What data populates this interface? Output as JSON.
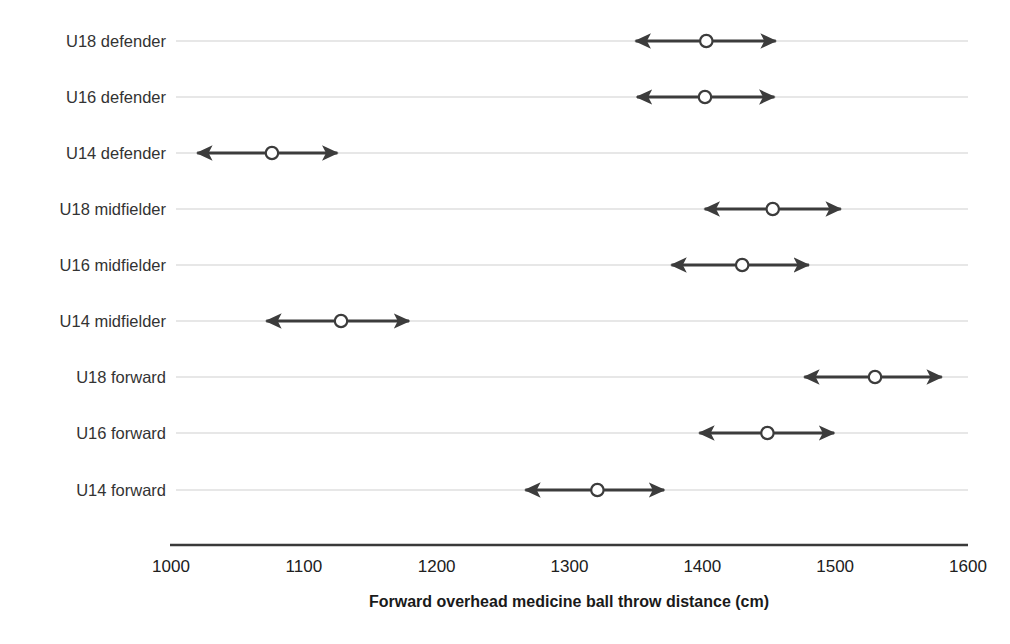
{
  "figure": {
    "background_color": "#ffffff",
    "line_color": "#3c3c3c",
    "grid_color": "#c9c9c9",
    "marker_fill": "#ffffff"
  },
  "axis": {
    "x_title": "Forward overhead medicine ball throw distance (cm)",
    "ticks": [
      "1000",
      "1100",
      "1200",
      "1300",
      "1400",
      "1500",
      "1600"
    ]
  },
  "chart_data": {
    "type": "scatter",
    "title": "",
    "xlabel": "Forward overhead medicine ball throw distance (cm)",
    "ylabel": "",
    "xlim": [
      1000,
      1600
    ],
    "grid": true,
    "legend": "none",
    "categories": [
      "U18 defender",
      "U16 defender",
      "U14 defender",
      "U18 midfielder",
      "U16 midfielder",
      "U14 midfielder",
      "U18 forward",
      "U16 forward",
      "U14 forward"
    ],
    "values": [
      1403,
      1402,
      1076,
      1453,
      1430,
      1128,
      1530,
      1449,
      1321
    ],
    "lower": [
      1343,
      1344,
      1013,
      1395,
      1370,
      1065,
      1470,
      1391,
      1260
    ],
    "upper": [
      1462,
      1461,
      1132,
      1511,
      1487,
      1186,
      1587,
      1506,
      1378
    ],
    "series": [
      {
        "name": "Mean with range",
        "points": [
          {
            "category": "U18 defender",
            "mean": 1403,
            "lower": 1343,
            "upper": 1462
          },
          {
            "category": "U16 defender",
            "mean": 1402,
            "lower": 1344,
            "upper": 1461
          },
          {
            "category": "U14 defender",
            "mean": 1076,
            "lower": 1013,
            "upper": 1132
          },
          {
            "category": "U18 midfielder",
            "mean": 1453,
            "lower": 1395,
            "upper": 1511
          },
          {
            "category": "U16 midfielder",
            "mean": 1430,
            "lower": 1370,
            "upper": 1487
          },
          {
            "category": "U14 midfielder",
            "mean": 1128,
            "lower": 1065,
            "upper": 1186
          },
          {
            "category": "U18 forward",
            "mean": 1530,
            "lower": 1470,
            "upper": 1587
          },
          {
            "category": "U16 forward",
            "mean": 1449,
            "lower": 1391,
            "upper": 1506
          },
          {
            "category": "U14 forward",
            "mean": 1321,
            "lower": 1260,
            "upper": 1378
          }
        ]
      }
    ]
  }
}
